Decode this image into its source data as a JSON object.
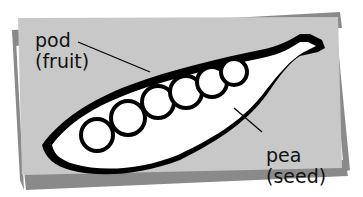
{
  "diagram": {
    "colors": {
      "card": "#c8c8c8",
      "shadow": "#8a8a8a",
      "ink": "#000000",
      "fill": "#ffffff"
    },
    "labels": {
      "pod": {
        "line1": "pod",
        "line2": "(fruit)"
      },
      "pea": {
        "line1": "pea",
        "line2": "(seed)"
      }
    },
    "pea_count": 6
  }
}
